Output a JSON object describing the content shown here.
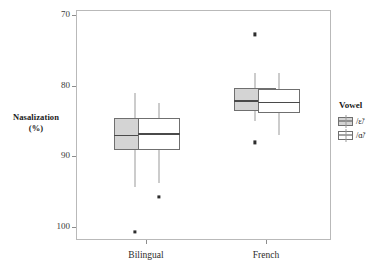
{
  "axes": {
    "ylabel_line1": "Nasalization",
    "ylabel_line2": "(%)",
    "yticks": [
      "100",
      "90",
      "80",
      "70"
    ],
    "xticks": [
      "Bilingual",
      "French"
    ]
  },
  "legend": {
    "title": "Vowel",
    "items": [
      {
        "label": "/ɛ̃/",
        "swatch": "filled",
        "color": "#d4d4d4"
      },
      {
        "label": "/ɑ̃/",
        "swatch": "open",
        "color": "#ffffff"
      }
    ]
  },
  "chart_data": {
    "type": "box",
    "title": "",
    "xlabel": "",
    "ylabel": "Nasalization (%)",
    "ylim": [
      68,
      101
    ],
    "yticks": [
      70,
      80,
      90,
      100
    ],
    "grid": false,
    "legend_position": "right",
    "legend_title": "Vowel",
    "categories": [
      "Bilingual",
      "French"
    ],
    "series": [
      {
        "name": "/ɛ̃/",
        "fill": "#d4d4d4",
        "boxes": [
          {
            "category": "Bilingual",
            "whisker_low": 75.8,
            "q1": 81.0,
            "median": 83.2,
            "q3": 85.5,
            "whisker_high": 89.1,
            "outliers": [
              69.5
            ]
          },
          {
            "category": "French",
            "whisker_low": 85.2,
            "q1": 86.5,
            "median": 88.1,
            "q3": 89.8,
            "whisker_high": 91.9,
            "outliers": [
              97.4,
              82.1
            ]
          }
        ]
      },
      {
        "name": "/ɑ̃/",
        "fill": "#ffffff",
        "boxes": [
          {
            "category": "Bilingual",
            "whisker_low": 76.4,
            "q1": 81.0,
            "median": 83.4,
            "q3": 85.5,
            "whisker_high": 87.7,
            "outliers": [
              74.4
            ]
          },
          {
            "category": "French",
            "whisker_low": 83.1,
            "q1": 86.3,
            "median": 87.9,
            "q3": 89.6,
            "whisker_high": 91.9,
            "outliers": []
          }
        ]
      }
    ]
  }
}
